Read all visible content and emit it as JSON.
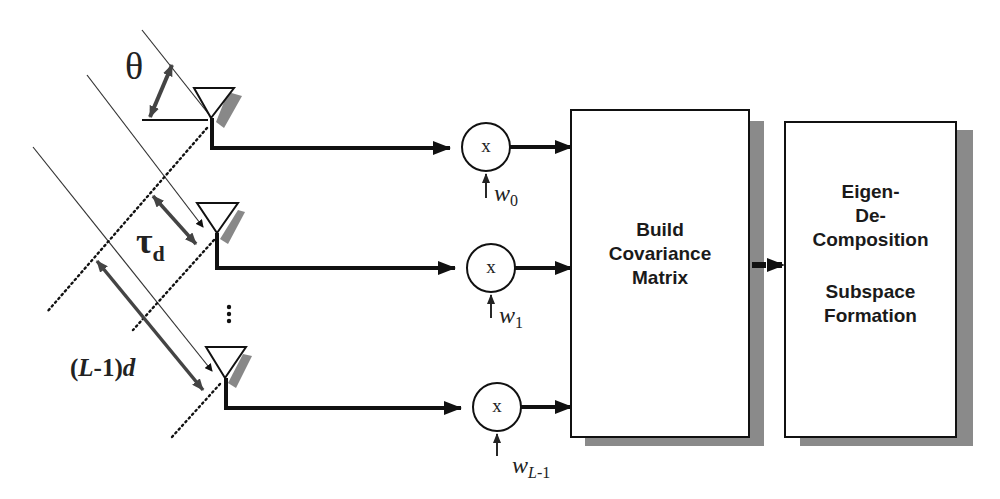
{
  "diagram": {
    "type": "antenna-array-subspace-processing",
    "labels": {
      "angle": "θ",
      "delay_symbol": "τ",
      "delay_sub": "d",
      "spacing_open": "(",
      "spacing_L": "L",
      "spacing_rest": "-1)",
      "spacing_d": "d",
      "ellipsis": "⋮"
    },
    "multipliers": [
      {
        "symbol": "x",
        "weight": "w",
        "sub": "0"
      },
      {
        "symbol": "x",
        "weight": "w",
        "sub": "1"
      },
      {
        "symbol": "x",
        "weight": "w",
        "sub_italic": "L",
        "sub": "-1"
      }
    ],
    "blocks": [
      {
        "lines": [
          "Build",
          "Covariance",
          "Matrix"
        ]
      },
      {
        "lines": [
          "Eigen-",
          "De-",
          "Composition",
          "",
          "Subspace",
          "Formation"
        ]
      }
    ],
    "colors": {
      "line": "#111111",
      "shadow": "#8a8a8a",
      "arrow_grey": "#4a4a4a",
      "background": "#ffffff"
    }
  }
}
